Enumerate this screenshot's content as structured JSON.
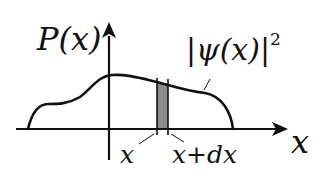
{
  "diagram": {
    "y_axis_label": "P(x)",
    "curve_label": "|ψ(x)|",
    "curve_label_exponent": "2",
    "x_axis_label": "x",
    "strip_left_label": "x",
    "strip_right_label": "x+dx",
    "colors": {
      "stroke": "#111111",
      "strip_fill": "#8c8c8c",
      "background": "#ffffff"
    }
  }
}
